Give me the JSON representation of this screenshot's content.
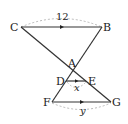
{
  "diagram": {
    "type": "geometry",
    "points": {
      "C": {
        "label": "C",
        "x": 21,
        "y": 27
      },
      "B": {
        "label": "B",
        "x": 102,
        "y": 27
      },
      "A": {
        "label": "A",
        "x": 73,
        "y": 71
      },
      "D": {
        "label": "D",
        "x": 66,
        "y": 81
      },
      "E": {
        "label": "E",
        "x": 86,
        "y": 81
      },
      "F": {
        "label": "F",
        "x": 52,
        "y": 102
      },
      "G": {
        "label": "G",
        "x": 111,
        "y": 102
      }
    },
    "segments": [
      "CB",
      "CG",
      "BF",
      "DE",
      "FG"
    ],
    "parallel_marks": [
      "CB",
      "DE",
      "FG"
    ],
    "measures": {
      "CB": "12",
      "DE": "x",
      "FG": "y"
    },
    "colors": {
      "line": "#333333",
      "dashed": "#aaaaaa"
    }
  }
}
